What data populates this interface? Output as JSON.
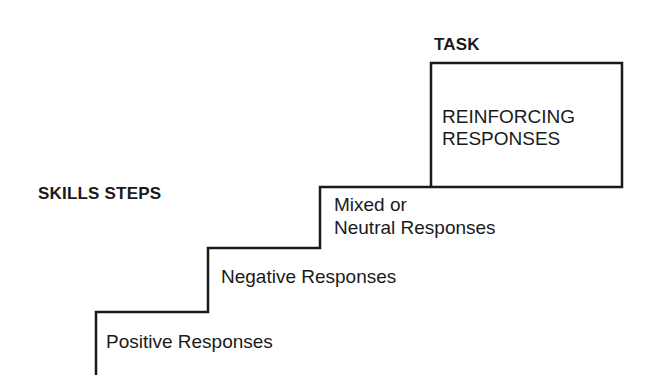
{
  "diagram": {
    "headings": {
      "task": "TASK",
      "skills_steps": "SKILLS STEPS"
    },
    "task_box": {
      "line1": "REINFORCING",
      "line2": "RESPONSES"
    },
    "steps": [
      {
        "level": 1,
        "label": "Positive Responses"
      },
      {
        "level": 2,
        "label": "Negative Responses"
      },
      {
        "level": 3,
        "line1": "Mixed or",
        "line2": "Neutral Responses"
      }
    ],
    "colors": {
      "line": "#1a1a1a",
      "background": "#ffffff"
    }
  }
}
